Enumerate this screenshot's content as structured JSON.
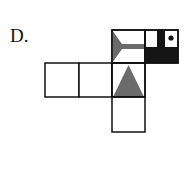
{
  "option_label": "D.",
  "colors": {
    "line": "#111111",
    "gray_fill": "#6b6b6b",
    "black_fill": "#141414",
    "background": "#ffffff"
  },
  "net": {
    "cell_size": 33,
    "faces": [
      {
        "id": "top-left",
        "row": 0,
        "col": 2,
        "pattern": "gray-arrow-tail-right"
      },
      {
        "id": "top-right",
        "row": 0,
        "col": 3,
        "pattern": "black-bottom-half-with-bar-and-dot"
      },
      {
        "id": "middle-1",
        "row": 1,
        "col": 0,
        "pattern": "blank"
      },
      {
        "id": "middle-2",
        "row": 1,
        "col": 1,
        "pattern": "blank"
      },
      {
        "id": "middle-3",
        "row": 1,
        "col": 2,
        "pattern": "gray-triangle-up"
      },
      {
        "id": "bottom",
        "row": 2,
        "col": 2,
        "pattern": "blank"
      }
    ]
  }
}
